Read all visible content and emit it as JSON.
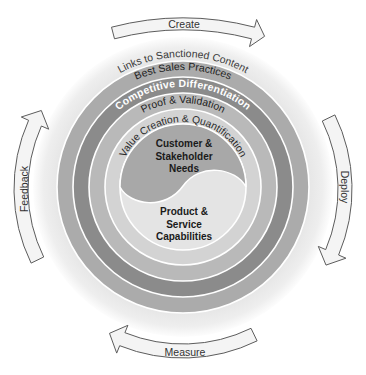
{
  "diagram": {
    "arrows": {
      "fill": "#f4f4f4",
      "stroke": "#5c5c5c"
    },
    "cycle_arrows": [
      {
        "label": "Create",
        "position": "top"
      },
      {
        "label": "Deploy",
        "position": "right"
      },
      {
        "label": "Measure",
        "position": "bottom"
      },
      {
        "label": "Feedback",
        "position": "left"
      }
    ],
    "rings": [
      {
        "label": "Links to Sanctioned Content",
        "color": "#e3e3e3",
        "text_color": "#3a3a3a"
      },
      {
        "label": "Best Sales Practices",
        "color": "#ababab",
        "text_color": "#222222"
      },
      {
        "label": "Competitive Differentiation",
        "color": "#8b8b8b",
        "text_color": "#ffffff"
      },
      {
        "label": "Proof & Validation",
        "color": "#b9b9b9",
        "text_color": "#222222"
      },
      {
        "label": "Value Creation & Quantification",
        "color": "#d3d3d3",
        "text_color": "#2a2a2a"
      }
    ],
    "core": {
      "top": {
        "lines": [
          "Customer &",
          "Stakeholder",
          "Needs"
        ],
        "color": "#a8a8a8"
      },
      "bottom": {
        "lines": [
          "Product &",
          "Service",
          "Capabilities"
        ],
        "color": "#e4e4e4"
      }
    },
    "separator_color": "#ffffff"
  }
}
